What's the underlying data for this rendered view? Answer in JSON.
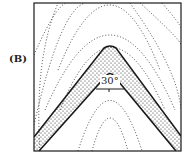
{
  "figure": {
    "panel_label": "(B)",
    "angle_label": "30°",
    "colors": {
      "line": "#1a1a1a",
      "background": "#ffffff"
    }
  }
}
